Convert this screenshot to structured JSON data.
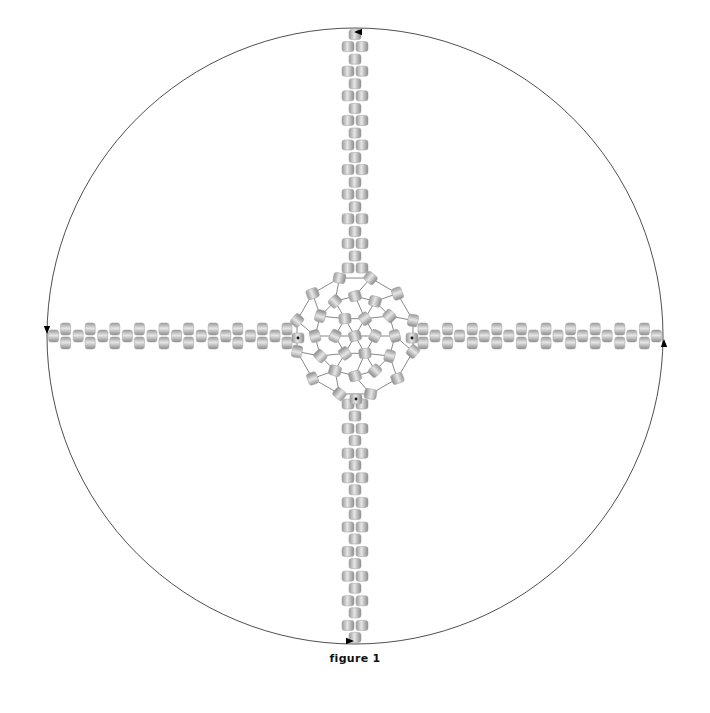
{
  "figure": {
    "caption": "figure 1",
    "center": [
      355,
      336
    ],
    "circle_radius": 308,
    "circle_stroke": "#222222",
    "bead_colors": {
      "light": "#e4e4e4",
      "mid": "#b8b8b8",
      "dark": "#8a8a8a",
      "edge": "#9a9a9a"
    },
    "bead_size": [
      12,
      10
    ],
    "arm": {
      "start_offset": 68,
      "unit_spacing": 24.6,
      "units": 10,
      "pair_offset": 7,
      "pair_shift": 12
    },
    "arms": [
      {
        "name": "top",
        "direction": [
          0,
          -1
        ]
      },
      {
        "name": "left",
        "direction": [
          -1,
          0
        ]
      },
      {
        "name": "bottom",
        "direction": [
          0,
          1
        ]
      },
      {
        "name": "right",
        "direction": [
          1,
          0
        ]
      }
    ],
    "hub": {
      "rings": [
        {
          "radius": 0,
          "count": 1
        },
        {
          "radius": 20,
          "count": 6
        },
        {
          "radius": 40,
          "count": 12
        },
        {
          "radius": 60,
          "count": 12
        }
      ],
      "thread_color": "#555555",
      "marker_beads": [
        "left",
        "right",
        "bottom"
      ]
    },
    "arrows": [
      {
        "position": "top",
        "point": [
          358,
          32
        ],
        "heading": "left"
      },
      {
        "position": "left",
        "point": [
          47,
          330
        ],
        "heading": "down"
      },
      {
        "position": "bottom",
        "point": [
          350,
          641
        ],
        "heading": "right"
      },
      {
        "position": "right",
        "point": [
          664,
          343
        ],
        "heading": "up"
      }
    ]
  }
}
